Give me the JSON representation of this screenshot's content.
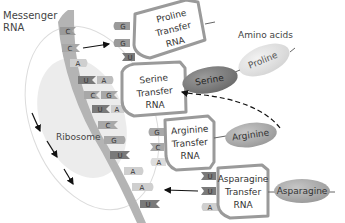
{
  "labels": {
    "messenger_rna_line1": "Messenger",
    "messenger_rna_line2": "RNA",
    "amino_acids": "Amino acids",
    "ribosome": "Ribosome"
  },
  "mrna_codons": [
    "C",
    "C",
    "A",
    "U",
    "C",
    "U",
    "C",
    "G",
    "U",
    "A",
    "A",
    "U"
  ],
  "trnas": [
    {
      "name_line1": "Proline",
      "name_line2": "Transfer",
      "name_line3": "RNA",
      "anticodons": [
        "G",
        "G",
        "U"
      ],
      "amino_acid": "Proline"
    },
    {
      "name_line1": "Serine",
      "name_line2": "Transfer",
      "name_line3": "RNA",
      "anticodons": [
        "A",
        "G",
        "A"
      ],
      "amino_acid": "Serine"
    },
    {
      "name_line1": "Arginine",
      "name_line2": "Transfer",
      "name_line3": "RNA",
      "anticodons": [
        "G",
        "C",
        "A"
      ],
      "amino_acid": "Arginine"
    },
    {
      "name_line1": "Asparagine",
      "name_line2": "Transfer",
      "name_line3": "RNA",
      "anticodons": [
        "U",
        "U",
        "A"
      ],
      "amino_acid": "Asparagine"
    }
  ],
  "amino_acid_ovals": {
    "proline": "Proline",
    "serine": "Serine",
    "arginine": "Arginine",
    "asparagine": "Asparagine"
  },
  "colors": {
    "strand": "#b4b4b4",
    "box_border": "#9a9a9a",
    "tab_dark": "#7a7a7a",
    "tab_mid": "#a8a8a8",
    "tab_light": "#cfcfcf",
    "oval_dark": "#7e7e7e",
    "oval_mid": "#a9a9a9",
    "oval_light": "#e2e2e2",
    "ribosome_fill": "#ececec"
  }
}
